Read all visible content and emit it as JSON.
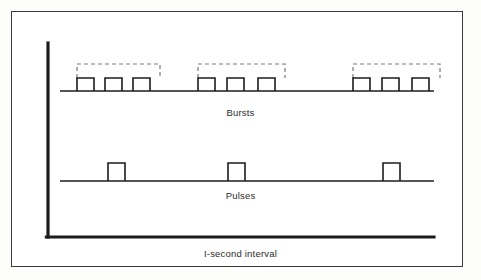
{
  "figure": {
    "title": "",
    "background_color": "#ffffff",
    "frame_color": "#3a3a3a",
    "line_color": "#1c1c1c",
    "dashed_color": "#7a7a7a"
  },
  "labels": {
    "bursts": "Bursts",
    "pulses": "Pulses",
    "interval": "I-second interval"
  },
  "axis": {
    "vertical_x": 48,
    "vertical_top": 43,
    "vertical_bottom": 237,
    "horizontal_left": 48,
    "horizontal_right": 434,
    "stroke_width": 3.2
  },
  "chart_data": {
    "type": "line",
    "title": "",
    "xlabel": "I-second interval",
    "ylabel": "",
    "grid": false,
    "legend": "none",
    "traces": [
      {
        "name": "Bursts",
        "baseline_y": 91,
        "pulse_top_y": 78,
        "baseline_x_start": 60,
        "baseline_x_end": 434,
        "pulse_width": 17,
        "groups": [
          {
            "index": 1,
            "bracket": {
              "x_start": 77,
              "x_end": 160,
              "y": 64
            },
            "pulses": [
              {
                "x_start": 77,
                "x_end": 94
              },
              {
                "x_start": 105,
                "x_end": 122
              },
              {
                "x_start": 133,
                "x_end": 150
              }
            ]
          },
          {
            "index": 2,
            "bracket": {
              "x_start": 198,
              "x_end": 285,
              "y": 64
            },
            "pulses": [
              {
                "x_start": 198,
                "x_end": 215
              },
              {
                "x_start": 227,
                "x_end": 244
              },
              {
                "x_start": 258,
                "x_end": 275
              }
            ]
          },
          {
            "index": 3,
            "bracket": {
              "x_start": 353,
              "x_end": 440,
              "y": 64
            },
            "pulses": [
              {
                "x_start": 353,
                "x_end": 370
              },
              {
                "x_start": 382,
                "x_end": 399
              },
              {
                "x_start": 412,
                "x_end": 429
              }
            ]
          }
        ]
      },
      {
        "name": "Pulses",
        "baseline_y": 181,
        "pulse_top_y": 163,
        "baseline_x_start": 60,
        "baseline_x_end": 434,
        "pulse_width": 17,
        "pulses": [
          {
            "x_start": 108,
            "x_end": 125
          },
          {
            "x_start": 228,
            "x_end": 245
          },
          {
            "x_start": 383,
            "x_end": 400
          }
        ]
      }
    ]
  }
}
